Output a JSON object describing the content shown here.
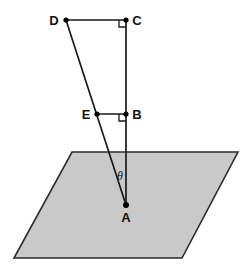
{
  "figure": {
    "canvas": {
      "width": 250,
      "height": 272,
      "background": "#ffffff"
    },
    "colors": {
      "plane_fill": "#c9c9c9",
      "plane_stroke": "#2b2b2b",
      "line_stroke": "#1a1a1a",
      "point_fill": "#000000",
      "label_color": "#111111"
    }
  },
  "plane": {
    "name": "horizontal-plane",
    "shape": "parallelogram",
    "points": "72,152 238,152 182,258 14,258",
    "fill": "#c9c9c9",
    "stroke": "#2b2b2b",
    "stroke_width": 1.6
  },
  "points": [
    {
      "id": "D",
      "label": "D",
      "x": 66,
      "y": 20,
      "label_x": 54,
      "label_y": 25,
      "dot": true
    },
    {
      "id": "C",
      "label": "C",
      "x": 126,
      "y": 20,
      "label_x": 133,
      "label_y": 25,
      "dot": true
    },
    {
      "id": "E",
      "label": "E",
      "x": 97,
      "y": 114,
      "label_x": 82,
      "label_y": 119,
      "dot": true
    },
    {
      "id": "B",
      "label": "B",
      "x": 126,
      "y": 114,
      "label_x": 133,
      "label_y": 119,
      "dot": true
    },
    {
      "id": "A",
      "label": "A",
      "x": 126,
      "y": 205,
      "label_x": 121,
      "label_y": 221,
      "dot": true
    }
  ],
  "segments": [
    {
      "id": "DC",
      "from": "D",
      "to": "C",
      "x1": 66,
      "y1": 20,
      "x2": 126,
      "y2": 20
    },
    {
      "id": "CA",
      "from": "C",
      "to": "A",
      "x1": 126,
      "y1": 20,
      "x2": 126,
      "y2": 205
    },
    {
      "id": "DA",
      "from": "D",
      "to": "A",
      "x1": 66,
      "y1": 20,
      "x2": 126,
      "y2": 205
    },
    {
      "id": "EB",
      "from": "E",
      "to": "B",
      "x1": 97,
      "y1": 114,
      "x2": 126,
      "y2": 114
    }
  ],
  "right_angles": [
    {
      "id": "right-angle-C",
      "at": "C",
      "path": "M 119,20 L 119,27 L 126,27",
      "note": "right angle at C"
    },
    {
      "id": "right-angle-B",
      "at": "B",
      "path": "M 119,114 L 119,121 L 126,121",
      "note": "right angle at B"
    }
  ],
  "angles": [
    {
      "id": "theta",
      "label": "θ",
      "at": "A",
      "label_x": 117,
      "label_y": 180,
      "between": [
        "AD",
        "AB"
      ]
    }
  ]
}
